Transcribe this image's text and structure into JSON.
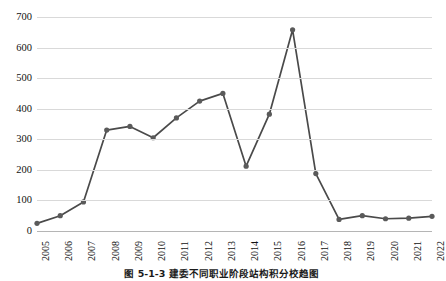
{
  "chart_data": {
    "type": "line",
    "title": "",
    "subtitle": "",
    "xlabel": "",
    "ylabel": "",
    "categories": [
      "2005",
      "2006",
      "2007",
      "2008",
      "2009",
      "2010",
      "2011",
      "2012",
      "2013",
      "2014",
      "2015",
      "2016",
      "2017",
      "2018",
      "2019",
      "2020",
      "2021",
      "2022"
    ],
    "series": [
      {
        "name": "",
        "values": [
          25,
          50,
          95,
          330,
          342,
          305,
          370,
          425,
          450,
          212,
          382,
          658,
          188,
          38,
          50,
          40,
          42,
          48
        ]
      }
    ],
    "ylim": [
      0,
      700
    ],
    "xlim_labels": [
      "2005",
      "2022"
    ],
    "yticks": [
      0,
      100,
      200,
      300,
      400,
      500,
      600,
      700
    ],
    "ytick_labels": [
      "0",
      "100",
      "200",
      "300",
      "400",
      "500",
      "600",
      "700"
    ],
    "grid": "horizontal",
    "legend": "none",
    "marker": "circle",
    "line_color": "#4a4a4a",
    "marker_color": "#5a5a5a",
    "grid_color": "#d9d9d9",
    "axis_color": "#b5b5b5",
    "background": "#ffffff"
  },
  "caption": {
    "text": "图 5-1-3  建委不同职业阶段站构积分校趋图"
  }
}
